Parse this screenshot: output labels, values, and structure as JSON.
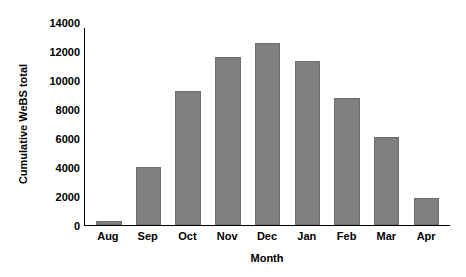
{
  "chart_data": {
    "type": "bar",
    "title": "",
    "xlabel": "Month",
    "ylabel": "Cumulative WeBS total",
    "categories": [
      "Aug",
      "Sep",
      "Oct",
      "Nov",
      "Dec",
      "Jan",
      "Feb",
      "Mar",
      "Apr"
    ],
    "values": [
      300,
      4100,
      9500,
      11950,
      12950,
      11650,
      9050,
      6250,
      1900
    ],
    "ylim": [
      0,
      14000
    ],
    "ytick_labels": [
      "14000",
      "12000",
      "10000",
      "8000",
      "6000",
      "4000",
      "2000",
      "0"
    ],
    "ytick_values": [
      14000,
      12000,
      10000,
      8000,
      6000,
      4000,
      2000,
      0
    ],
    "grid": false,
    "legend": false,
    "bar_color": "#808080",
    "axis_color": "#000000",
    "background": "#ffffff"
  }
}
